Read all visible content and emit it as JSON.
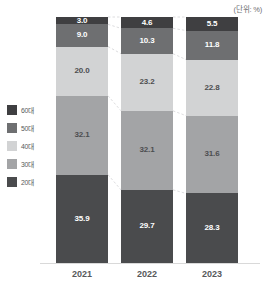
{
  "unit_label": "(단위: %)",
  "legend": {
    "items": [
      {
        "label": "60대",
        "color": "#3f3f41"
      },
      {
        "label": "50대",
        "color": "#6e6f71"
      },
      {
        "label": "40대",
        "color": "#d2d3d4"
      },
      {
        "label": "30대",
        "color": "#a3a4a6"
      },
      {
        "label": "20대",
        "color": "#4a4b4d"
      }
    ]
  },
  "chart_data": {
    "type": "bar",
    "subtype": "stacked-100-percent",
    "title": "",
    "subtitle": "",
    "xlabel": "",
    "ylabel": "",
    "unit": "%",
    "ylim": [
      0,
      100
    ],
    "grid": false,
    "legend_position": "left",
    "orientation": "vertical",
    "categories": [
      "2021",
      "2022",
      "2023"
    ],
    "stack_order_top_to_bottom": [
      "60대",
      "50대",
      "40대",
      "30대",
      "20대"
    ],
    "series": [
      {
        "name": "60대",
        "color": "#3f3f41",
        "text_color": "light",
        "values": [
          3.0,
          4.6,
          5.5
        ]
      },
      {
        "name": "50대",
        "color": "#6e6f71",
        "text_color": "light",
        "values": [
          9.0,
          10.3,
          11.8
        ]
      },
      {
        "name": "40대",
        "color": "#d2d3d4",
        "text_color": "dark",
        "values": [
          20.0,
          23.2,
          22.8
        ]
      },
      {
        "name": "30대",
        "color": "#a3a4a6",
        "text_color": "dark",
        "values": [
          32.1,
          32.1,
          31.6
        ]
      },
      {
        "name": "20대",
        "color": "#4a4b4d",
        "text_color": "light",
        "values": [
          35.9,
          29.7,
          28.3
        ]
      }
    ],
    "data_labels": {
      "2021": [
        "3.0",
        "9.0",
        "20.0",
        "32.1",
        "35.9"
      ],
      "2022": [
        "4.6",
        "10.3",
        "23.2",
        "32.1",
        "29.7"
      ],
      "2023": [
        "5.5",
        "11.8",
        "22.8",
        "31.6",
        "28.3"
      ]
    },
    "totals": [
      100.0,
      99.9,
      100.0
    ],
    "connector_lines": true,
    "connector_style": "dashed"
  }
}
